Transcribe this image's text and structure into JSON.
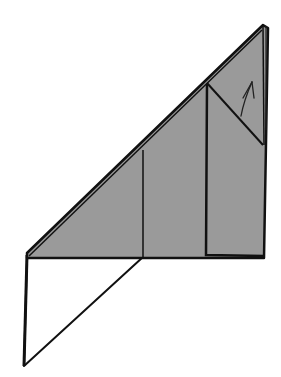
{
  "diagram": {
    "type": "origami-fold-step",
    "colors": {
      "background": "#ffffff",
      "colored_side": "#9a9a9a",
      "white_side": "#ffffff",
      "line": "#111111"
    },
    "shapes": {
      "gray_triangle": [
        [
          27,
          253
        ],
        [
          263,
          25
        ],
        [
          268,
          28
        ],
        [
          264,
          258
        ],
        [
          27,
          258
        ]
      ],
      "white_flap": [
        [
          27,
          257
        ],
        [
          143,
          257
        ],
        [
          24,
          366
        ]
      ],
      "center_crease": [
        [
          143,
          150
        ],
        [
          143,
          257
        ]
      ],
      "inner_panel": [
        [
          206,
          84
        ],
        [
          206,
          255
        ],
        [
          263,
          256
        ]
      ],
      "diagonal_fold": [
        [
          207,
          83
        ],
        [
          263,
          145
        ]
      ],
      "layer_edges": [
        [
          [
            263,
            25
          ],
          [
            266,
            145
          ]
        ],
        [
          [
            266,
            26
          ],
          [
            267,
            120
          ]
        ]
      ]
    },
    "arrow": {
      "direction": "fold-up",
      "from": [
        241,
        115
      ],
      "to": [
        252,
        82
      ]
    },
    "dashed_valley_line": [
      [
        218,
        96
      ],
      [
        260,
        141
      ]
    ]
  }
}
